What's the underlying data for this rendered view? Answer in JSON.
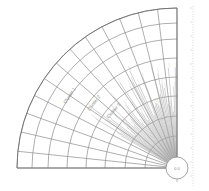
{
  "figure": {
    "background_color": "#ffffff",
    "width": 209,
    "height": 191
  },
  "chart_data": {
    "type": "line",
    "title": "",
    "subtitle": "",
    "xlabel": "",
    "ylabel": "",
    "grid": true,
    "legend_position": "none",
    "polar": {
      "origin_x": 177,
      "origin_y": 168,
      "angle_start_deg": 90,
      "angle_end_deg": 180,
      "radius_outer": 160,
      "radius_hub": 11
    },
    "arc_radii": [
      11,
      32,
      52,
      72,
      91,
      110,
      129,
      145,
      160
    ],
    "arc_count": 9,
    "spoke_angles_deg": [
      90,
      97,
      104,
      111,
      118,
      125,
      132,
      139,
      146,
      153,
      160,
      167,
      174,
      180
    ],
    "spoke_count": 14,
    "leaf_branches": {
      "count": 46,
      "angle_start_deg": 91,
      "angle_end_deg": 150,
      "radius_inner": 11,
      "radius_outer_min": 52,
      "radius_outer_max": 108
    },
    "sector_labels": [
      {
        "text": "Cluster 1",
        "radius": 128,
        "angle_deg": 146
      },
      {
        "text": "Cluster 2",
        "radius": 104,
        "angle_deg": 142
      },
      {
        "text": "Cluster 3",
        "radius": 84,
        "angle_deg": 138
      }
    ],
    "hub_label": "0.0",
    "baseline_label": "0",
    "axis_tick_line": {
      "x": 193,
      "y_top": 6,
      "y_bottom": 186,
      "style": "dotted",
      "color": "#c9c9c9"
    }
  },
  "colors": {
    "grid_line": "#8c8c8c",
    "outline": "#707070",
    "leaf_line": "#a8a8a8",
    "label_text": "#8a8a8a",
    "axis_dotted": "#c9c9c9",
    "background": "#ffffff"
  }
}
